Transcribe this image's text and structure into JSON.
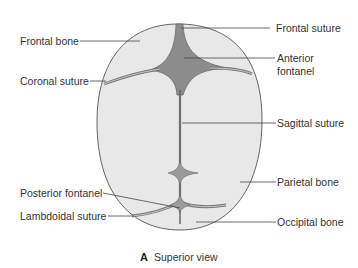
{
  "figure": {
    "caption_letter": "A",
    "caption_text": "Superior view"
  },
  "labels": {
    "frontal_bone": "Frontal bone",
    "coronal_suture": "Coronal suture",
    "frontal_suture": "Frontal suture",
    "anterior_fontanel_line1": "Anterior",
    "anterior_fontanel_line2": "fontanel",
    "sagittal_suture": "Sagittal suture",
    "parietal_bone": "Parietal bone",
    "posterior_fontanel": "Posterior fontanel",
    "lambdoidal_suture": "Lambdoidal suture",
    "occipital_bone": "Occipital bone"
  },
  "colors": {
    "bone_fill": "#e8e8e8",
    "fontanel_fill": "#8c8c8c",
    "outline": "#555555",
    "suture": "#6e6e6e",
    "leader_line": "#444444",
    "text": "#333333"
  }
}
